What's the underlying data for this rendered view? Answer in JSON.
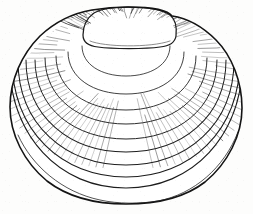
{
  "figure": {
    "title": "Clam shell",
    "style": "line-engraving",
    "medium": "pen-and-ink hatched engraving",
    "orientation": "exterior valve, umbo uppermost",
    "background_color": "#fdfdfc",
    "ink_color": "#1a1a1a",
    "hatch_color": "#3a3a3a",
    "canvas": {
      "width": 253,
      "height": 214
    }
  },
  "shell_geometry": {
    "outline": {
      "left_extreme_x": 10,
      "right_extreme_x": 242,
      "top_y": 6,
      "bottom_y": 203,
      "center_x": 126,
      "widest_y": 112
    },
    "umbo": {
      "label": "umbo",
      "apex_x": 128,
      "apex_y": 7,
      "left_x": 96,
      "right_x": 172,
      "base_y": 44
    },
    "growth_rings_count": 9,
    "growth_rings": [
      {
        "index": 1,
        "center_y": 46,
        "rx": 44,
        "ry": 30
      },
      {
        "index": 2,
        "center_y": 52,
        "rx": 58,
        "ry": 42
      },
      {
        "index": 3,
        "center_y": 56,
        "rx": 70,
        "ry": 54
      },
      {
        "index": 4,
        "center_y": 58,
        "rx": 81,
        "ry": 66
      },
      {
        "index": 5,
        "center_y": 60,
        "rx": 91,
        "ry": 79
      },
      {
        "index": 6,
        "center_y": 60,
        "rx": 100,
        "ry": 92
      },
      {
        "index": 7,
        "center_y": 60,
        "rx": 108,
        "ry": 105
      },
      {
        "index": 8,
        "center_y": 58,
        "rx": 114,
        "ry": 119
      },
      {
        "index": 9,
        "center_y": 56,
        "rx": 117,
        "ry": 132
      }
    ],
    "radial_hatching": {
      "left_flank_strokes": 46,
      "right_flank_strokes": 44,
      "shoulder_density": "dense",
      "ventral_density": "sparse"
    }
  },
  "labels": {
    "figure_caption": "",
    "alt_text": "Engraved line drawing of a clam shell seen from the outside, with concentric growth rings and radial hatching along both flanks."
  }
}
